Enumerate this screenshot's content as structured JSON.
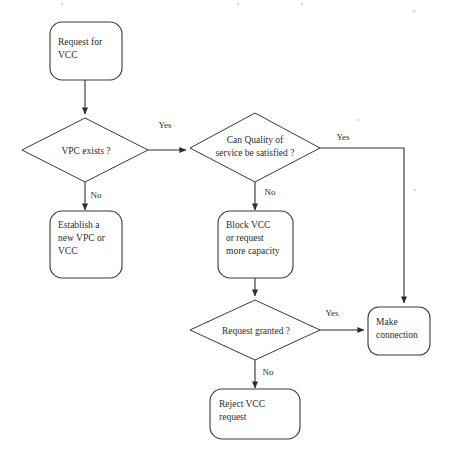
{
  "diagram": {
    "type": "flowchart",
    "background_color": "#ffffff",
    "line_color": "#2e2e2e",
    "text_color": "#2b2b2b",
    "nodes": [
      {
        "id": "request-for-vcc",
        "shape": "rounded-rectangle",
        "lines": [
          "Request for",
          "VCC"
        ]
      },
      {
        "id": "vpc-exists",
        "shape": "diamond",
        "lines": [
          "VPC exists  ?"
        ]
      },
      {
        "id": "can-quality-of-service-be-satisfied",
        "shape": "diamond",
        "lines": [
          "Can Quality of",
          "service be satisfied  ?"
        ]
      },
      {
        "id": "establish-new-vpc-or-vcc",
        "shape": "rounded-rectangle",
        "lines": [
          "Establish  a",
          "new VPC or",
          "VCC"
        ]
      },
      {
        "id": "block-vcc-or-request-more-capacity",
        "shape": "rounded-rectangle",
        "lines": [
          "Block VCC",
          "or request",
          "more capacity"
        ]
      },
      {
        "id": "request-granted",
        "shape": "diamond",
        "lines": [
          "Request granted ?"
        ]
      },
      {
        "id": "make-connection",
        "shape": "rounded-rectangle",
        "lines": [
          "Make",
          "connection"
        ]
      },
      {
        "id": "reject-vcc-request",
        "shape": "rounded-rectangle",
        "lines": [
          "Reject VCC",
          "request"
        ]
      }
    ],
    "edges": [
      {
        "id": "e1",
        "from": "request-for-vcc",
        "to": "vpc-exists",
        "label": ""
      },
      {
        "id": "e2",
        "from": "vpc-exists",
        "to": "can-quality-of-service-be-satisfied",
        "label": "Yes"
      },
      {
        "id": "e3",
        "from": "vpc-exists",
        "to": "establish-new-vpc-or-vcc",
        "label": "No"
      },
      {
        "id": "e4",
        "from": "can-quality-of-service-be-satisfied",
        "to": "make-connection",
        "label": "Yes"
      },
      {
        "id": "e5",
        "from": "can-quality-of-service-be-satisfied",
        "to": "block-vcc-or-request-more-capacity",
        "label": "No"
      },
      {
        "id": "e6",
        "from": "block-vcc-or-request-more-capacity",
        "to": "request-granted",
        "label": ""
      },
      {
        "id": "e7",
        "from": "request-granted",
        "to": "make-connection",
        "label": "Yes"
      },
      {
        "id": "e8",
        "from": "request-granted",
        "to": "reject-vcc-request",
        "label": "No"
      }
    ],
    "edge_labels": {
      "yes_1": "Yes",
      "yes_2": "Yes",
      "yes_3": "Yes",
      "no_1": "No",
      "no_2": "No",
      "no_3": "No"
    },
    "node_text": {
      "request_for_vcc_l1": "Request for",
      "request_for_vcc_l2": "VCC",
      "vpc_exists_l1": "VPC exists  ?",
      "qos_l1": "Can Quality of",
      "qos_l2": "service be satisfied  ?",
      "establish_l1": "Establish  a",
      "establish_l2": "new VPC or",
      "establish_l3": "VCC",
      "block_l1": "Block VCC",
      "block_l2": "or request",
      "block_l3": "more capacity",
      "request_granted_l1": "Request granted ?",
      "make_connection_l1": "Make",
      "make_connection_l2": "connection",
      "reject_l1": "Reject VCC",
      "reject_l2": "request"
    }
  }
}
